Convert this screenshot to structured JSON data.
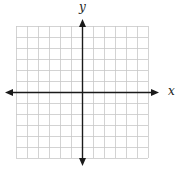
{
  "figure": {
    "type": "coordinate-plane",
    "x_axis_label": "x",
    "y_axis_label": "y",
    "grid": {
      "columns": 12,
      "rows": 12,
      "left": 16,
      "top": 26,
      "cell": 11,
      "line_color": "#c8c8c8"
    },
    "axes": {
      "color": "#1a1a1a",
      "origin_x": 82,
      "origin_y": 92,
      "x_start": 5,
      "x_end": 159,
      "y_start": 19,
      "y_end": 166
    }
  }
}
